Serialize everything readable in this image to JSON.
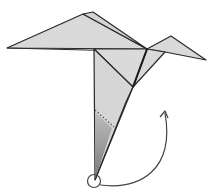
{
  "diagram": {
    "title": "Origami crane step: fold tail point up",
    "colors": {
      "paper": "#d9d9d9",
      "line": "#2a2a2a",
      "shade_dark": "#8a8a8a",
      "arrow": "#444444",
      "background": "#ffffff"
    },
    "annotations": {
      "fold_marker": "circle at bottom tip",
      "arrow": "curved arrow pointing up-right",
      "crease": "dotted crease line"
    }
  }
}
